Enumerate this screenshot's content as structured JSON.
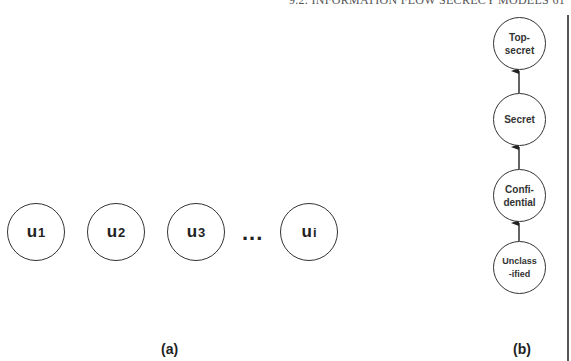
{
  "header": {
    "running_head": "9.2. INFORMATION FLOW SECRECY MODELS   61"
  },
  "panel_a": {
    "caption": "(a)",
    "users": [
      {
        "base": "u",
        "sub": "1"
      },
      {
        "base": "u",
        "sub": "2"
      },
      {
        "base": "u",
        "sub": "3"
      },
      {
        "base": "u",
        "sub": "i"
      }
    ],
    "ellipsis": "..."
  },
  "panel_b": {
    "caption": "(b)",
    "levels": [
      {
        "label": "Top-\nsecret"
      },
      {
        "label": "Secret"
      },
      {
        "label": "Confi-\ndential"
      },
      {
        "label": "Unclass\n-ified"
      }
    ],
    "edges": [
      {
        "from": "Unclassified",
        "to": "Confidential"
      },
      {
        "from": "Confidential",
        "to": "Secret"
      },
      {
        "from": "Secret",
        "to": "Top-secret"
      }
    ]
  },
  "colors": {
    "stroke": "#333333",
    "background": "#ffffff"
  }
}
